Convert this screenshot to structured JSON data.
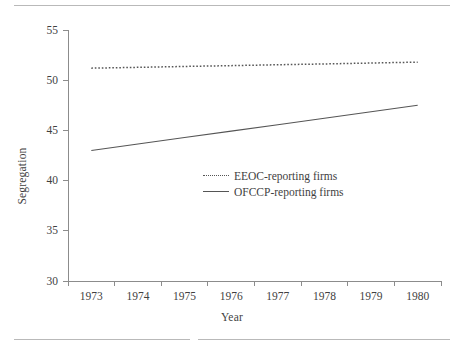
{
  "chart_data": {
    "type": "line",
    "title": "",
    "subtitle": "",
    "xlabel": "Year",
    "ylabel": "Segregation",
    "x": [
      1973,
      1974,
      1975,
      1976,
      1977,
      1978,
      1979,
      1980
    ],
    "categories": [
      "1973",
      "1974",
      "1975",
      "1976",
      "1977",
      "1978",
      "1979",
      "1980"
    ],
    "series": [
      {
        "name": "EEOC-reporting firms",
        "style": "dotted",
        "color": "#555555",
        "values": [
          51.2,
          51.28,
          51.37,
          51.45,
          51.54,
          51.62,
          51.71,
          51.8
        ]
      },
      {
        "name": "OFCCP-reporting firms",
        "style": "solid",
        "color": "#555555",
        "values": [
          43.0,
          43.64,
          44.29,
          44.93,
          45.57,
          46.21,
          46.86,
          47.5
        ]
      }
    ],
    "xlim": [
      1972.5,
      1980.5
    ],
    "ylim": [
      30,
      55
    ],
    "yticks": [
      30,
      35,
      40,
      45,
      50,
      55
    ],
    "ytick_labels": [
      "30",
      "35",
      "40",
      "45",
      "50",
      "55"
    ],
    "xtick_labels": [
      "1973",
      "1974",
      "1975",
      "1976",
      "1977",
      "1978",
      "1979",
      "1980"
    ],
    "grid": false,
    "legend_position": "center",
    "axis_color": "#8c8c8c",
    "text_color": "#3f3f3f"
  },
  "legend": {
    "entries": [
      {
        "label": "EEOC-reporting firms"
      },
      {
        "label": "OFCCP-reporting firms"
      }
    ]
  },
  "rules": {
    "top_color": "#b9b9b9",
    "bottom_color": "#b9b9b9"
  }
}
